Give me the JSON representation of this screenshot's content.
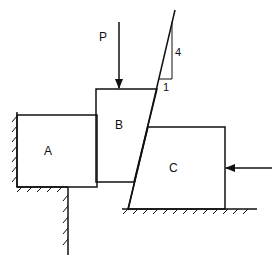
{
  "diagram": {
    "type": "statics-wedge-problem",
    "blocks": [
      {
        "id": "A",
        "label": "A"
      },
      {
        "id": "B",
        "label": "B"
      },
      {
        "id": "C",
        "label": "C"
      }
    ],
    "loads": [
      {
        "label": "P",
        "direction": "down",
        "applied_to": "B"
      },
      {
        "label": "",
        "direction": "left",
        "applied_to": "C"
      }
    ],
    "slope": {
      "rise": "4",
      "run": "1"
    },
    "colors": {
      "stroke": "#111111",
      "background": "#ffffff"
    }
  }
}
